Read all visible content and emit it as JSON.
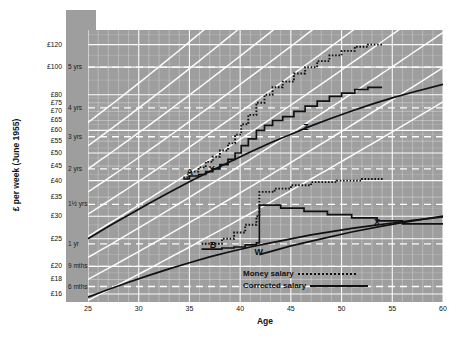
{
  "chart_data": {
    "type": "line",
    "title": "",
    "xlabel": "Age",
    "ylabel": "£ per week (June 1955)",
    "xlim": [
      25,
      60
    ],
    "ylim": [
      15,
      135
    ],
    "yscale": "log",
    "grid": true,
    "legend_position": "bottom-right",
    "x_ticks": [
      25,
      30,
      35,
      40,
      45,
      50,
      55,
      60
    ],
    "y_ticks": [
      16,
      18,
      20,
      25,
      30,
      35,
      40,
      45,
      50,
      55,
      60,
      65,
      70,
      75,
      80,
      100,
      120
    ],
    "y_tick_labels": [
      "£16",
      "£18",
      "£20",
      "£25",
      "£30",
      "£35",
      "£40",
      "£45",
      "£50",
      "£55",
      "£60",
      "£65",
      "£70",
      "£75",
      "£80",
      "£100",
      "£120"
    ],
    "time_span_axis_title": "Time Span",
    "time_span_labels": [
      {
        "label": "5 yrs",
        "value": 100
      },
      {
        "label": "4 yrs",
        "value": 72
      },
      {
        "label": "3 yrs",
        "value": 57
      },
      {
        "label": "2 yrs",
        "value": 44
      },
      {
        "label": "1½ yrs",
        "value": 33
      },
      {
        "label": "1 yr",
        "value": 24
      },
      {
        "label": "9 mths",
        "value": 20
      },
      {
        "label": "6 mths",
        "value": 17
      }
    ],
    "legend": [
      {
        "name": "Money salary",
        "style": "dotted"
      },
      {
        "name": "Corrected salary",
        "style": "solid"
      }
    ],
    "annotations": [
      {
        "label": "A",
        "x": 35.1,
        "y": 42.5
      },
      {
        "label": "Y",
        "x": 37.3,
        "y": 43.5
      },
      {
        "label": "Z",
        "x": 46.6,
        "y": 61.0
      },
      {
        "label": "B",
        "x": 37.4,
        "y": 23.6
      },
      {
        "label": "W",
        "x": 41.8,
        "y": 22.2
      },
      {
        "label": "X",
        "x": 53.6,
        "y": 28.4
      }
    ],
    "series": [
      {
        "name": "Capacity progression band A (corrected salary)",
        "style": "solid",
        "x": [
          25,
          27,
          29,
          31,
          33,
          35,
          37,
          39,
          41,
          43,
          45,
          47,
          49,
          51,
          53,
          55,
          57,
          60
        ],
        "values": [
          25.0,
          27.6,
          30.3,
          33.2,
          36.3,
          39.6,
          43.0,
          46.6,
          50.4,
          54.3,
          58.2,
          62.2,
          66.2,
          70.2,
          74.2,
          78.0,
          81.6,
          87.0
        ]
      },
      {
        "name": "Capacity progression band B (corrected salary)",
        "style": "solid",
        "x": [
          25,
          27,
          29,
          31,
          33,
          35,
          37,
          39,
          41,
          43,
          45,
          47,
          49,
          51,
          53,
          55,
          57,
          60
        ],
        "values": [
          15.6,
          16.6,
          17.6,
          18.6,
          19.6,
          20.6,
          21.6,
          22.5,
          23.4,
          24.2,
          25.0,
          25.8,
          26.5,
          27.2,
          27.8,
          28.4,
          29.0,
          29.8
        ]
      },
      {
        "name": "Career A money salary (dotted staircase)",
        "style": "dotted",
        "x": [
          34.4,
          35.0,
          35.0,
          35.9,
          35.9,
          36.6,
          36.6,
          37.3,
          37.3,
          38.0,
          38.0,
          38.8,
          38.8,
          39.5,
          39.5,
          40.1,
          40.1,
          40.8,
          40.8,
          41.6,
          41.6,
          42.4,
          42.4,
          43.2,
          43.2,
          44.2,
          44.2,
          45.3,
          45.3,
          46.4,
          46.4,
          47.6,
          47.6,
          48.8,
          48.8,
          50.0,
          50.0,
          51.3,
          51.3,
          52.6,
          52.6,
          54.0
        ],
        "values": [
          41.0,
          41.0,
          43.0,
          43.0,
          44.5,
          44.5,
          46.5,
          46.5,
          48.5,
          48.5,
          51.0,
          51.0,
          54.0,
          54.0,
          58.0,
          58.0,
          63.0,
          63.0,
          68.0,
          68.0,
          75.0,
          75.0,
          80.0,
          80.0,
          85.0,
          85.0,
          89.0,
          89.0,
          95.0,
          95.0,
          100.0,
          100.0,
          105.0,
          105.0,
          110.0,
          110.0,
          114.0,
          114.0,
          118.0,
          118.0,
          120.0,
          120.0
        ]
      },
      {
        "name": "Career A corrected salary (solid staircase)",
        "style": "solid",
        "x": [
          34.4,
          35.0,
          35.0,
          35.9,
          35.9,
          36.6,
          36.6,
          37.3,
          37.3,
          38.0,
          38.0,
          38.8,
          38.8,
          39.5,
          39.5,
          40.1,
          40.1,
          40.8,
          40.8,
          41.6,
          41.6,
          42.4,
          42.4,
          43.2,
          43.2,
          44.2,
          44.2,
          45.3,
          45.3,
          46.4,
          46.4,
          47.6,
          47.6,
          48.8,
          48.8,
          50.0,
          50.0,
          51.3,
          51.3,
          52.6,
          52.6,
          54.0
        ],
        "values": [
          40.5,
          40.5,
          41.5,
          41.5,
          42.0,
          42.0,
          43.0,
          43.0,
          44.0,
          44.0,
          45.5,
          45.5,
          47.5,
          47.5,
          50.0,
          50.0,
          53.0,
          53.0,
          56.0,
          56.0,
          60.0,
          60.0,
          62.5,
          62.5,
          65.0,
          65.0,
          67.0,
          67.0,
          70.0,
          70.0,
          73.0,
          73.0,
          76.0,
          76.0,
          79.0,
          79.0,
          81.0,
          81.0,
          83.5,
          83.5,
          85.0,
          85.0
        ]
      },
      {
        "name": "Career B money salary (dotted staircase)",
        "style": "dotted",
        "x": [
          36.2,
          38.2,
          38.2,
          39.4,
          39.4,
          40.5,
          40.5,
          41.6,
          41.6,
          41.9,
          41.9,
          43.4,
          43.4,
          45.0,
          45.0,
          47.0,
          47.0,
          49.5,
          49.5,
          52.0,
          52.0,
          54.2
        ],
        "values": [
          24.0,
          24.0,
          25.0,
          25.0,
          26.3,
          26.3,
          28.0,
          28.0,
          30.0,
          30.0,
          36.5,
          36.5,
          37.5,
          37.5,
          38.5,
          38.5,
          39.5,
          39.5,
          40.0,
          40.0,
          40.5,
          40.5
        ]
      },
      {
        "name": "Career B corrected salary (solid staircase to W then decline to X)",
        "style": "solid",
        "x": [
          36.2,
          38.2,
          38.2,
          39.4,
          39.4,
          40.5,
          40.5,
          41.6,
          41.6,
          41.9,
          41.9,
          44.0,
          44.0,
          46.3,
          46.3,
          48.6,
          48.6,
          51.0,
          51.0,
          53.5,
          53.5,
          56.0,
          56.0,
          60.0
        ],
        "values": [
          23.0,
          23.0,
          23.2,
          23.2,
          23.4,
          23.4,
          23.8,
          23.8,
          24.2,
          24.2,
          32.8,
          32.8,
          32.0,
          32.0,
          31.2,
          31.2,
          30.4,
          30.4,
          29.6,
          29.6,
          28.9,
          28.9,
          28.2,
          28.2
        ]
      },
      {
        "name": "W to X recovery line (corrected)",
        "style": "solid",
        "x": [
          41.9,
          45,
          48,
          51,
          54,
          57,
          60
        ],
        "values": [
          22.0,
          23.6,
          25.0,
          26.4,
          27.7,
          28.9,
          30.0
        ]
      }
    ]
  }
}
